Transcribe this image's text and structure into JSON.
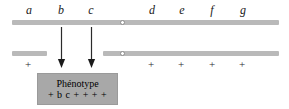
{
  "figure": {
    "type": "genetics-chromosome-diagram",
    "background_color": "#ffffff",
    "bar_color": "#b9b9b9",
    "box_color": "#a8a8a8",
    "text_color": "#1a1a1a"
  },
  "top_chromosome": {
    "name": "top-chromosome",
    "gene_labels": [
      {
        "text": "a",
        "x": 29
      },
      {
        "text": "b",
        "x": 61
      },
      {
        "text": "c",
        "x": 91
      },
      {
        "text": "d",
        "x": 152
      },
      {
        "text": "e",
        "x": 182
      },
      {
        "text": "f",
        "x": 212
      },
      {
        "text": "g",
        "x": 243
      }
    ],
    "centromere_x": 122
  },
  "bottom_chromosome": {
    "name": "bottom-chromosome",
    "left_fragment": {
      "start_x": 12,
      "end_x": 47
    },
    "right_fragment": {
      "start_x": 103,
      "end_x": 279
    },
    "centromere_x": 122,
    "plus_marks": [
      {
        "text": "+",
        "x": 28
      },
      {
        "text": "+",
        "x": 151
      },
      {
        "text": "+",
        "x": 181
      },
      {
        "text": "+",
        "x": 212
      },
      {
        "text": "+",
        "x": 242
      }
    ]
  },
  "arrows": [
    {
      "name": "arrow-b",
      "x": 61
    },
    {
      "name": "arrow-c",
      "x": 91
    }
  ],
  "phenotype_box": {
    "title": "Phénotype",
    "formula": "+ b c + + + +"
  }
}
